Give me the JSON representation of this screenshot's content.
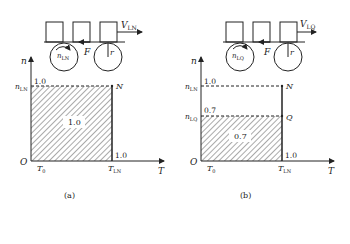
{
  "panels": [
    {
      "id": "a",
      "caption": "(a)",
      "velocity": {
        "base": "V",
        "sub": "LN"
      },
      "wheel_speed": {
        "base": "n",
        "sub": "LN"
      },
      "force": "F",
      "radius": "r",
      "axis_y": "n",
      "axis_x": "T",
      "origin": "O",
      "y_tick": {
        "base": "n",
        "sub": "LN"
      },
      "y_tick_value": "1.0",
      "x_tick0": {
        "base": "T",
        "sub": "0"
      },
      "x_tick1": {
        "base": "T",
        "sub": "LN"
      },
      "x_tick_value": "1.0",
      "point_top": "N",
      "area_label": "1.0"
    },
    {
      "id": "b",
      "caption": "(b)",
      "velocity": {
        "base": "V",
        "sub": "LQ"
      },
      "wheel_speed": {
        "base": "n",
        "sub": "LQ"
      },
      "force": "F",
      "radius": "r",
      "axis_y": "n",
      "axis_x": "T",
      "origin": "O",
      "y_tick": {
        "base": "n",
        "sub": "LN"
      },
      "y_tick_value": "1.0",
      "y_tick2": {
        "base": "n",
        "sub": "LQ"
      },
      "y_tick2_value": "0.7",
      "x_tick0": {
        "base": "T",
        "sub": "0"
      },
      "x_tick1": {
        "base": "T",
        "sub": "LN"
      },
      "x_tick_value": "1.0",
      "point_top": "N",
      "point_mid": "Q",
      "area_label": "0.7"
    }
  ]
}
